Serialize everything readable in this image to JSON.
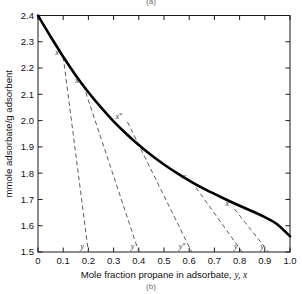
{
  "figure": {
    "top_label": "(a)",
    "bottom_label": "(b)"
  },
  "axes": {
    "x_title_main": "Mole fraction propane in adsorbate,",
    "x_title_italic": "y, x",
    "y_title": "mmole adsorbate/g adsorbent",
    "x_ticklabels": [
      "0",
      "0.1",
      "0.2",
      "0.3",
      "0.4",
      "0.5",
      "0.6",
      "0.7",
      "0.8",
      "0.9",
      "1.0"
    ],
    "y_ticklabels": [
      "1.5",
      "1.6",
      "1.7",
      "1.8",
      "1.9",
      "2.0",
      "2.1",
      "2.2",
      "2.3",
      "2.4"
    ]
  },
  "colors": {
    "curve": "#000000",
    "tieline": "#4a4a4a",
    "axis": "#1a1a1a",
    "background": "#ffffff"
  },
  "chart_data": {
    "type": "line",
    "title": "",
    "xlabel": "Mole fraction propane in adsorbate, y, x",
    "ylabel": "mmole adsorbate/g adsorbent",
    "xlim": [
      0,
      1.0
    ],
    "ylim": [
      1.5,
      2.4
    ],
    "xticks": [
      0,
      0.1,
      0.2,
      0.3,
      0.4,
      0.5,
      0.6,
      0.7,
      0.8,
      0.9,
      1.0
    ],
    "yticks": [
      1.5,
      1.6,
      1.7,
      1.8,
      1.9,
      2.0,
      2.1,
      2.2,
      2.3,
      2.4
    ],
    "grid": false,
    "legend": "none",
    "series": [
      {
        "name": "total adsorbate loading curve",
        "x": [
          0.0,
          0.05,
          0.1,
          0.15,
          0.2,
          0.25,
          0.3,
          0.35,
          0.4,
          0.45,
          0.5,
          0.55,
          0.6,
          0.65,
          0.7,
          0.75,
          0.8,
          0.85,
          0.9,
          0.95,
          1.0
        ],
        "y": [
          2.4,
          2.32,
          2.243,
          2.172,
          2.108,
          2.05,
          1.997,
          1.95,
          1.907,
          1.868,
          1.833,
          1.801,
          1.772,
          1.745,
          1.721,
          1.698,
          1.676,
          1.655,
          1.633,
          1.605,
          1.56
        ]
      }
    ],
    "tie_lines": [
      {
        "label_x": "x",
        "label_y": "y",
        "x_point": [
          0.1,
          2.243
        ],
        "y_point": [
          0.2,
          1.5
        ]
      },
      {
        "label_x": "x",
        "label_y": "y",
        "x_point": [
          0.18,
          2.135
        ],
        "y_point": [
          0.4,
          1.5
        ]
      },
      {
        "label_x": "x*",
        "label_y": "y*",
        "x_point": [
          0.355,
          1.995
        ],
        "y_point": [
          0.61,
          1.5
        ]
      },
      {
        "label_x": "x",
        "label_y": "y",
        "x_point": [
          0.61,
          1.768
        ],
        "y_point": [
          0.81,
          1.5
        ]
      },
      {
        "label_x": "x",
        "label_y": "y",
        "x_point": [
          0.78,
          1.663
        ],
        "y_point": [
          0.915,
          1.5
        ]
      }
    ]
  }
}
